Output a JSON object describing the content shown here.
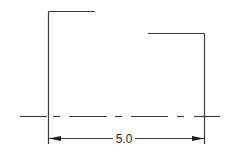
{
  "drawing": {
    "dimension_label": "5.0",
    "colors": {
      "line": "#3a3a3a",
      "arrow": "#1e1e1e",
      "text": "#2a2a2a",
      "background": "#ffffff"
    },
    "elements": [
      "left-bracket",
      "right-bracket",
      "centerline",
      "dimension-line"
    ]
  }
}
